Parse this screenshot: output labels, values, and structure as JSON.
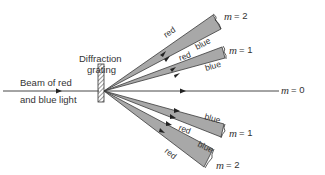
{
  "diagram": {
    "title_label": "Diffraction",
    "title_label_line2": "grating",
    "incident_label_line1": "Beam of red",
    "incident_label_line2": "and blue light",
    "orders": [
      {
        "m_symbol": "m",
        "m_value": "= 2",
        "side": "upper",
        "colors": [
          "red",
          "blue"
        ]
      },
      {
        "m_symbol": "m",
        "m_value": "= 1",
        "side": "upper",
        "colors": [
          "red",
          "blue"
        ]
      },
      {
        "m_symbol": "m",
        "m_value": "= 0",
        "side": "center"
      },
      {
        "m_symbol": "m",
        "m_value": "= 1",
        "side": "lower",
        "colors": [
          "blue",
          "red"
        ]
      },
      {
        "m_symbol": "m",
        "m_value": "= 2",
        "side": "lower",
        "colors": [
          "blue",
          "red"
        ]
      }
    ],
    "beam_labels": {
      "upper_m2_red": "red",
      "upper_m2_blue": "blue",
      "upper_m1_red": "red",
      "upper_m1_blue": "blue",
      "lower_m1_blue": "blue",
      "lower_m1_red": "red",
      "lower_m2_blue": "blue",
      "lower_m2_red": "red"
    },
    "colors": {
      "beam_fill": "#a8a8a8",
      "line": "#333333"
    }
  }
}
